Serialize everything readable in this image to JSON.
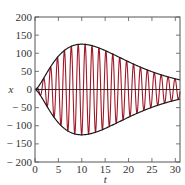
{
  "chart_data": {
    "type": "line",
    "title": "",
    "xlabel": "t",
    "ylabel": "x",
    "xlim": [
      0,
      31
    ],
    "ylim": [
      -200,
      200
    ],
    "xticks": [
      0,
      5,
      10,
      15,
      20,
      25,
      30
    ],
    "yticks": [
      200,
      150,
      100,
      50,
      0,
      -50,
      -100,
      -150,
      -200
    ],
    "ytick_labels": [
      "200",
      "150",
      "100",
      "50",
      "0",
      "− 50",
      "− 100",
      "− 150",
      "− 200"
    ],
    "grid": false,
    "legend": null,
    "series": [
      {
        "name": "oscillation",
        "color": "#a01828",
        "description": "Modulated oscillation x(t) = E(t)·sin(ωt), about 21 cycles over t∈[0,31]",
        "omega": 4.25,
        "envelope_peak": 125,
        "envelope_peak_t": 10,
        "envelope_shape_p": 1.6
      },
      {
        "name": "upper-envelope",
        "color": "#1a1a1a",
        "x": [
          0,
          2.5,
          5,
          7.5,
          10,
          12.5,
          15,
          17.5,
          20,
          22.5,
          25,
          27.5,
          30,
          31
        ],
        "values": [
          0,
          35,
          72,
          108,
          125,
          118,
          100,
          80,
          60,
          44,
          32,
          23,
          16,
          14
        ]
      },
      {
        "name": "lower-envelope",
        "color": "#1a1a1a",
        "x": [
          0,
          2.5,
          5,
          7.5,
          10,
          12.5,
          15,
          17.5,
          20,
          22.5,
          25,
          27.5,
          30,
          31
        ],
        "values": [
          0,
          -35,
          -72,
          -108,
          -125,
          -118,
          -100,
          -80,
          -60,
          -44,
          -32,
          -23,
          -16,
          -14
        ]
      },
      {
        "name": "zero-line",
        "color": "#1a1a1a",
        "x": [
          0,
          31
        ],
        "values": [
          0,
          0
        ]
      }
    ]
  },
  "layout": {
    "plot_left": 35,
    "plot_right": 180,
    "plot_top": 17,
    "plot_bottom": 162
  }
}
